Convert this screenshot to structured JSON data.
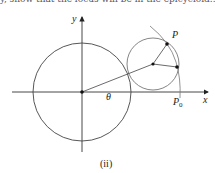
{
  "top_text": "y, show that the locus will be in the epicycloid...",
  "diagram": {
    "labels": {
      "y_axis": "y",
      "x_axis": "x",
      "angle": "θ",
      "point_p": "P",
      "point_p0": "P",
      "point_p0_sub": "0"
    },
    "caption": "(ii)",
    "colors": {
      "stroke": "#333333",
      "curve": "#777777"
    }
  }
}
